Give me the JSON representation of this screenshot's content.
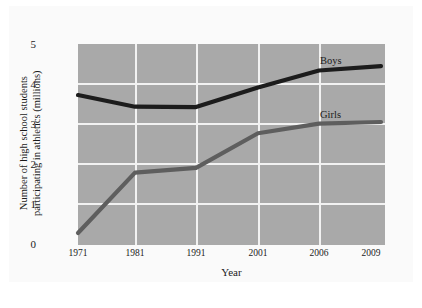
{
  "chart_data": {
    "type": "line",
    "title": "",
    "xlabel": "Year",
    "ylabel": "Number of high school students participating in athletics (millions)",
    "ylabel_line1": "Number of high school students",
    "ylabel_line2": "participating in athletics (millions)",
    "categories": [
      "1971",
      "1981",
      "1991",
      "2001",
      "2006",
      "2009"
    ],
    "ylim": [
      0,
      5
    ],
    "yticks": [
      "0",
      "1",
      "2",
      "3",
      "4",
      "5"
    ],
    "grid": true,
    "legend_position": "inline-right",
    "series": [
      {
        "name": "Boys",
        "color": "#1c1c1c",
        "values": [
          3.73,
          3.44,
          3.43,
          3.92,
          4.34,
          4.45
        ]
      },
      {
        "name": "Girls",
        "color": "#5e5e5e",
        "values": [
          0.3,
          1.8,
          1.92,
          2.78,
          3.02,
          3.06
        ]
      }
    ],
    "plot_background": "#a9a9a9",
    "gridline_color": "#f2f2f2"
  }
}
